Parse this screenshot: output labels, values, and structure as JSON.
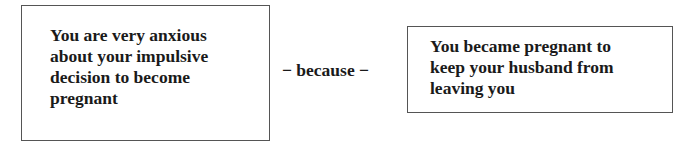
{
  "diagram": {
    "left_box": {
      "text": "You are very anxious\nabout your impulsive\ndecision to become\npregnant"
    },
    "connector": {
      "text": "− because −"
    },
    "right_box": {
      "text": "You became pregnant to\nkeep your husband from\nleaving you"
    }
  }
}
